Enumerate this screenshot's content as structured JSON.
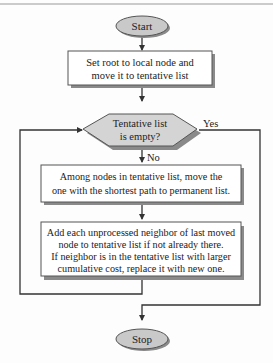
{
  "diagram": {
    "type": "flowchart",
    "colors": {
      "terminal_fill": "#c9c9c9",
      "decision_fill": "#d4d4d4",
      "process_fill": "#ffffff",
      "line": "#333333",
      "text": "#222222"
    },
    "nodes": {
      "start": {
        "label": "Start"
      },
      "init": {
        "lines": [
          "Set root to local node and",
          "move it to tentative list"
        ]
      },
      "decision": {
        "lines": [
          "Tentative list",
          "is empty?"
        ]
      },
      "move": {
        "lines": [
          "Among nodes in tentative list, move the",
          "one with the shortest path to permanent list."
        ]
      },
      "add": {
        "lines": [
          "Add each unprocessed neighbor of last moved",
          "node to tentative list if not already there.",
          "If neighbor is in the tentative list with larger",
          "cumulative cost, replace it with new one."
        ]
      },
      "stop": {
        "label": "Stop"
      }
    },
    "edge_labels": {
      "yes": "Yes",
      "no": "No"
    }
  }
}
